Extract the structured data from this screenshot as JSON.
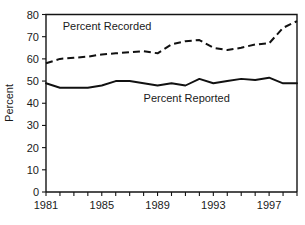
{
  "chart_data": {
    "type": "line",
    "title": "",
    "xlabel": "",
    "ylabel": "Percent",
    "xlim": [
      1981,
      1999
    ],
    "ylim": [
      0,
      80
    ],
    "ytick_labels": [
      "0",
      "10",
      "20",
      "30",
      "40",
      "50",
      "60",
      "70",
      "80"
    ],
    "yticks": [
      0,
      10,
      20,
      30,
      40,
      50,
      60,
      70,
      80
    ],
    "xticks": [
      1981,
      1982,
      1983,
      1984,
      1985,
      1986,
      1987,
      1988,
      1989,
      1990,
      1991,
      1992,
      1993,
      1994,
      1995,
      1996,
      1997,
      1998,
      1999
    ],
    "xtick_labels": [
      "1981",
      "",
      "",
      "",
      "1985",
      "",
      "",
      "",
      "1989",
      "",
      "",
      "",
      "1993",
      "",
      "",
      "",
      "1997",
      "",
      ""
    ],
    "x": [
      1981,
      1982,
      1983,
      1984,
      1985,
      1986,
      1987,
      1988,
      1989,
      1990,
      1991,
      1992,
      1993,
      1994,
      1995,
      1996,
      1997,
      1998,
      1999
    ],
    "grid": false,
    "legend_position": "inline-annotation",
    "series": [
      {
        "name": "Percent Recorded",
        "style": "dashed",
        "color": "#111111",
        "label_text": "Percent Recorded",
        "values": [
          58,
          60,
          60.5,
          61,
          62,
          62.5,
          63,
          63.5,
          62.5,
          66.5,
          68,
          68.5,
          65,
          64,
          65,
          66.5,
          67,
          74,
          77
        ]
      },
      {
        "name": "Percent Reported",
        "style": "solid",
        "color": "#111111",
        "label_text": "Percent Reported",
        "values": [
          49,
          47,
          47,
          47,
          48,
          50,
          50,
          49,
          48,
          49,
          48,
          51,
          49,
          50,
          51,
          50.5,
          51.5,
          49,
          49
        ]
      }
    ],
    "annotations": [
      {
        "text": "Percent Recorded",
        "x": 1982.2,
        "y": 73
      },
      {
        "text": "Percent Reported",
        "x": 1988.0,
        "y": 40.5
      }
    ]
  }
}
